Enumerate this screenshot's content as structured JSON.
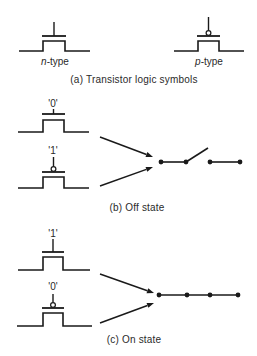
{
  "colors": {
    "ink": "#1a1a1a",
    "text": "#2a2a2a",
    "background": "#ffffff"
  },
  "panels": [
    {
      "id": "a",
      "caption": "(a)  Transistor logic symbols",
      "caption_pos": [
        134,
        80
      ],
      "symbols": [
        {
          "type": "n",
          "label": "n-type",
          "label_prefix": "n",
          "label_suffix": "-type",
          "label_pos": [
            55,
            62
          ],
          "x0": 19,
          "x1": 43,
          "x2": 65,
          "x3": 90,
          "base_y": 51,
          "top_y": 41,
          "plate_y": 36,
          "stem_top": 22
        },
        {
          "type": "p",
          "label": "p-type",
          "label_prefix": "p",
          "label_suffix": "-type",
          "label_pos": [
            209,
            62
          ],
          "x0": 174,
          "x1": 198,
          "x2": 219,
          "x3": 244,
          "base_y": 51,
          "top_y": 41,
          "plate_y": 36,
          "stem_top": 17
        }
      ]
    },
    {
      "id": "b",
      "caption": "(b)  Off state",
      "caption_pos": [
        137,
        208
      ],
      "symbols": [
        {
          "type": "n",
          "logic": "'0'",
          "logic_pos": [
            53,
            104
          ],
          "x0": 18,
          "x1": 43,
          "x2": 64,
          "x3": 89,
          "base_y": 132,
          "top_y": 120,
          "plate_y": 114,
          "stem_top": 109
        },
        {
          "type": "p",
          "logic": "'1'",
          "logic_pos": [
            53,
            151
          ],
          "x0": 18,
          "x1": 43,
          "x2": 64,
          "x3": 89,
          "base_y": 188,
          "top_y": 177,
          "plate_y": 172,
          "stem_top": 157
        }
      ],
      "arrows": [
        {
          "from": [
            100,
            137
          ],
          "to": [
            153,
            157
          ]
        },
        {
          "from": [
            100,
            186
          ],
          "to": [
            153,
            167
          ]
        }
      ],
      "switch": {
        "state": "open",
        "y": 162,
        "dots": [
          161,
          186,
          210,
          240
        ],
        "segments": [
          [
            161,
            186
          ],
          [
            210,
            240
          ]
        ],
        "lever": {
          "from": [
            186,
            162
          ],
          "to": [
            208,
            148
          ]
        }
      }
    },
    {
      "id": "c",
      "caption": "(c)  On state",
      "caption_pos": [
        134,
        340
      ],
      "symbols": [
        {
          "type": "n",
          "logic": "'1'",
          "logic_pos": [
            53,
            234
          ],
          "x0": 18,
          "x1": 43,
          "x2": 63,
          "x3": 90,
          "base_y": 270,
          "top_y": 257,
          "plate_y": 252,
          "stem_top": 239
        },
        {
          "type": "p",
          "logic": "'0'",
          "logic_pos": [
            53,
            287
          ],
          "x0": 17,
          "x1": 43,
          "x2": 63,
          "x3": 92,
          "base_y": 326,
          "top_y": 313,
          "plate_y": 308,
          "stem_top": 294
        }
      ],
      "arrows": [
        {
          "from": [
            100,
            274
          ],
          "to": [
            154,
            293
          ]
        },
        {
          "from": [
            100,
            323
          ],
          "to": [
            154,
            303
          ]
        }
      ],
      "switch": {
        "state": "closed",
        "y": 295,
        "dots": [
          159,
          187,
          210,
          238
        ],
        "segments": [
          [
            159,
            238
          ]
        ],
        "lever": null
      }
    }
  ]
}
